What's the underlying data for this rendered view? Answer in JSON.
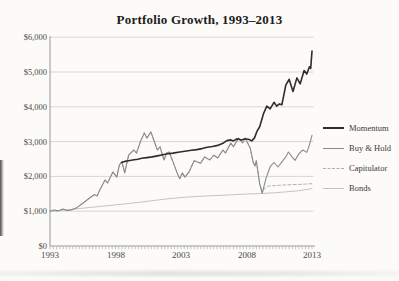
{
  "page": {
    "title": "Portfolio Growth, 1993–2013"
  },
  "chart_data": {
    "type": "line",
    "title": "Portfolio Growth, 1993–2013",
    "xlabel": "",
    "ylabel": "",
    "xlim": [
      1993,
      2013
    ],
    "ylim": [
      0,
      6000
    ],
    "grid": "horizontal",
    "legend_position": "right",
    "x_tick_years": [
      1993,
      1998,
      2003,
      2008,
      2013
    ],
    "x_tick_labels": [
      "1993",
      "1998",
      "2003",
      "2008",
      "2013"
    ],
    "minor_x_tick_interval_years": 0.25,
    "y_tick_values": [
      0,
      1000,
      2000,
      3000,
      4000,
      5000,
      6000
    ],
    "y_tick_labels": [
      "$0",
      "$1,000",
      "$2,000",
      "$3,000",
      "$4,000",
      "$5,000",
      "$6,000"
    ],
    "series": [
      {
        "name": "Momentum",
        "color": "#2d2d2d",
        "width": 1.6,
        "dash": null,
        "points": [
          [
            1998.45,
            2400
          ],
          [
            1998.7,
            2430
          ],
          [
            1999.0,
            2450
          ],
          [
            1999.3,
            2470
          ],
          [
            1999.7,
            2490
          ],
          [
            2000.0,
            2520
          ],
          [
            2000.4,
            2540
          ],
          [
            2000.8,
            2560
          ],
          [
            2001.2,
            2590
          ],
          [
            2001.6,
            2620
          ],
          [
            2002.0,
            2650
          ],
          [
            2002.4,
            2670
          ],
          [
            2002.9,
            2700
          ],
          [
            2003.3,
            2720
          ],
          [
            2003.8,
            2750
          ],
          [
            2004.2,
            2770
          ],
          [
            2004.6,
            2800
          ],
          [
            2005.0,
            2840
          ],
          [
            2005.4,
            2860
          ],
          [
            2005.8,
            2890
          ],
          [
            2006.2,
            2950
          ],
          [
            2006.5,
            3030
          ],
          [
            2006.8,
            3050
          ],
          [
            2007.0,
            3020
          ],
          [
            2007.3,
            3080
          ],
          [
            2007.6,
            3050
          ],
          [
            2007.9,
            3080
          ],
          [
            2008.2,
            3060
          ],
          [
            2008.4,
            3020
          ],
          [
            2008.6,
            3100
          ],
          [
            2008.8,
            3300
          ],
          [
            2009.0,
            3420
          ],
          [
            2009.3,
            3800
          ],
          [
            2009.55,
            4020
          ],
          [
            2009.8,
            3940
          ],
          [
            2010.1,
            4130
          ],
          [
            2010.3,
            4020
          ],
          [
            2010.5,
            4080
          ],
          [
            2010.7,
            4060
          ],
          [
            2011.0,
            4620
          ],
          [
            2011.25,
            4790
          ],
          [
            2011.55,
            4440
          ],
          [
            2011.85,
            4830
          ],
          [
            2012.1,
            4660
          ],
          [
            2012.4,
            5040
          ],
          [
            2012.6,
            4940
          ],
          [
            2012.8,
            5150
          ],
          [
            2012.9,
            5100
          ],
          [
            2013.0,
            5600
          ]
        ]
      },
      {
        "name": "Buy & Hold",
        "color": "#8a8a8a",
        "width": 1.1,
        "dash": null,
        "points": [
          [
            1993.0,
            1000
          ],
          [
            1993.3,
            1035
          ],
          [
            1993.6,
            1010
          ],
          [
            1994.0,
            1060
          ],
          [
            1994.3,
            1020
          ],
          [
            1994.7,
            1045
          ],
          [
            1995.0,
            1090
          ],
          [
            1995.5,
            1230
          ],
          [
            1996.0,
            1370
          ],
          [
            1996.4,
            1480
          ],
          [
            1996.6,
            1440
          ],
          [
            1996.8,
            1610
          ],
          [
            1997.2,
            1900
          ],
          [
            1997.4,
            1810
          ],
          [
            1997.8,
            2130
          ],
          [
            1998.1,
            1980
          ],
          [
            1998.3,
            2330
          ],
          [
            1998.5,
            2410
          ],
          [
            1998.7,
            2100
          ],
          [
            1999.0,
            2610
          ],
          [
            1999.4,
            2760
          ],
          [
            1999.6,
            2670
          ],
          [
            1999.9,
            3000
          ],
          [
            2000.2,
            3250
          ],
          [
            2000.4,
            3100
          ],
          [
            2000.7,
            3280
          ],
          [
            2001.0,
            2960
          ],
          [
            2001.2,
            2760
          ],
          [
            2001.4,
            2850
          ],
          [
            2001.7,
            2470
          ],
          [
            2001.9,
            2670
          ],
          [
            2002.1,
            2700
          ],
          [
            2002.4,
            2410
          ],
          [
            2002.7,
            2100
          ],
          [
            2002.9,
            1930
          ],
          [
            2003.1,
            2100
          ],
          [
            2003.3,
            1980
          ],
          [
            2003.6,
            2120
          ],
          [
            2004.0,
            2450
          ],
          [
            2004.5,
            2380
          ],
          [
            2004.8,
            2560
          ],
          [
            2005.2,
            2470
          ],
          [
            2005.5,
            2610
          ],
          [
            2005.8,
            2530
          ],
          [
            2006.2,
            2760
          ],
          [
            2006.4,
            2670
          ],
          [
            2006.8,
            2960
          ],
          [
            2007.0,
            2850
          ],
          [
            2007.4,
            3100
          ],
          [
            2007.7,
            2960
          ],
          [
            2007.9,
            3100
          ],
          [
            2008.3,
            2800
          ],
          [
            2008.5,
            2410
          ],
          [
            2008.65,
            2300
          ],
          [
            2008.75,
            2450
          ],
          [
            2009.0,
            1800
          ],
          [
            2009.2,
            1520
          ],
          [
            2009.5,
            1950
          ],
          [
            2009.8,
            2280
          ],
          [
            2010.1,
            2400
          ],
          [
            2010.4,
            2270
          ],
          [
            2010.7,
            2420
          ],
          [
            2011.0,
            2560
          ],
          [
            2011.2,
            2700
          ],
          [
            2011.5,
            2550
          ],
          [
            2011.7,
            2460
          ],
          [
            2012.0,
            2650
          ],
          [
            2012.3,
            2760
          ],
          [
            2012.6,
            2690
          ],
          [
            2012.8,
            2900
          ],
          [
            2013.0,
            3180
          ]
        ]
      },
      {
        "name": "Capitulator",
        "color": "#b2b2b2",
        "width": 1.0,
        "dash": "3 2.2",
        "points": [
          [
            1993.0,
            1000
          ],
          [
            1993.3,
            1035
          ],
          [
            1993.6,
            1010
          ],
          [
            1994.0,
            1060
          ],
          [
            1994.3,
            1020
          ],
          [
            1994.7,
            1045
          ],
          [
            1995.0,
            1090
          ],
          [
            1995.5,
            1230
          ],
          [
            1996.0,
            1370
          ],
          [
            1996.4,
            1480
          ],
          [
            1996.6,
            1440
          ],
          [
            1996.8,
            1610
          ],
          [
            1997.2,
            1900
          ],
          [
            1997.4,
            1810
          ],
          [
            1997.8,
            2130
          ],
          [
            1998.1,
            1980
          ],
          [
            1998.3,
            2330
          ],
          [
            1998.5,
            2410
          ],
          [
            1998.7,
            2100
          ],
          [
            1999.0,
            2610
          ],
          [
            1999.4,
            2760
          ],
          [
            1999.6,
            2670
          ],
          [
            1999.9,
            3000
          ],
          [
            2000.2,
            3250
          ],
          [
            2000.4,
            3100
          ],
          [
            2000.7,
            3280
          ],
          [
            2001.0,
            2960
          ],
          [
            2001.2,
            2760
          ],
          [
            2001.4,
            2850
          ],
          [
            2001.7,
            2470
          ],
          [
            2001.9,
            2670
          ],
          [
            2002.1,
            2700
          ],
          [
            2002.4,
            2410
          ],
          [
            2002.7,
            2100
          ],
          [
            2002.9,
            1930
          ],
          [
            2003.1,
            2100
          ],
          [
            2003.3,
            1980
          ],
          [
            2003.6,
            2120
          ],
          [
            2004.0,
            2450
          ],
          [
            2004.5,
            2380
          ],
          [
            2004.8,
            2560
          ],
          [
            2005.2,
            2470
          ],
          [
            2005.5,
            2610
          ],
          [
            2005.8,
            2530
          ],
          [
            2006.2,
            2760
          ],
          [
            2006.4,
            2670
          ],
          [
            2006.8,
            2960
          ],
          [
            2007.0,
            2850
          ],
          [
            2007.4,
            3100
          ],
          [
            2007.7,
            2960
          ],
          [
            2007.9,
            3100
          ],
          [
            2008.3,
            2800
          ],
          [
            2008.5,
            2410
          ],
          [
            2008.65,
            2300
          ],
          [
            2008.75,
            2450
          ],
          [
            2009.0,
            1800
          ],
          [
            2009.2,
            1520
          ],
          [
            2009.35,
            1640
          ],
          [
            2009.6,
            1720
          ],
          [
            2010.0,
            1730
          ],
          [
            2010.5,
            1745
          ],
          [
            2011.0,
            1755
          ],
          [
            2011.5,
            1765
          ],
          [
            2012.0,
            1770
          ],
          [
            2012.5,
            1778
          ],
          [
            2013.0,
            1790
          ]
        ]
      },
      {
        "name": "Bonds",
        "color": "#c4c4c4",
        "width": 1.0,
        "dash": null,
        "points": [
          [
            1993,
            1000
          ],
          [
            1994,
            1030
          ],
          [
            1995,
            1065
          ],
          [
            1996,
            1105
          ],
          [
            1997,
            1145
          ],
          [
            1998,
            1180
          ],
          [
            1999,
            1220
          ],
          [
            2000,
            1265
          ],
          [
            2001,
            1310
          ],
          [
            2002,
            1355
          ],
          [
            2003,
            1395
          ],
          [
            2004,
            1420
          ],
          [
            2005,
            1440
          ],
          [
            2006,
            1455
          ],
          [
            2007,
            1475
          ],
          [
            2008,
            1495
          ],
          [
            2009,
            1505
          ],
          [
            2010,
            1525
          ],
          [
            2011,
            1555
          ],
          [
            2012,
            1590
          ],
          [
            2013,
            1650
          ]
        ]
      }
    ],
    "colors": {
      "grid": "#c9c9c9",
      "axis": "#979797",
      "tick": "#9a9a9a",
      "label_text": "#4a4a4a",
      "title_text": "#1c1c1c"
    }
  },
  "legend": {
    "items": [
      {
        "label": "Momentum"
      },
      {
        "label": "Buy & Hold"
      },
      {
        "label": "Capitulator"
      },
      {
        "label": "Bonds"
      }
    ]
  }
}
